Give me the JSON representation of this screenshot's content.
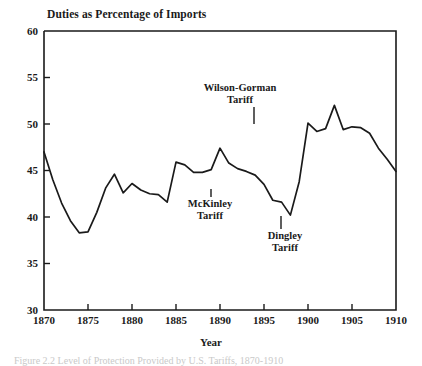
{
  "figure": {
    "title": "Duties as Percentage of Imports",
    "xlabel": "Year",
    "caption": "Figure 2.2 Level of Protection Provided by U.S. Tariffs, 1870-1910"
  },
  "axes": {
    "y_ticks": [
      "60",
      "55",
      "50",
      "45",
      "40",
      "35",
      "30"
    ],
    "x_ticks": [
      "1870",
      "1875",
      "1880",
      "1885",
      "1890",
      "1895",
      "1900",
      "1905",
      "1910"
    ]
  },
  "annotations": [
    {
      "name": "wilson-gorman",
      "line1": "Wilson-Gorman",
      "line2": "Tariff"
    },
    {
      "name": "mckinley",
      "line1": "McKinley",
      "line2": "Tariff"
    },
    {
      "name": "dingley",
      "line1": "Dingley",
      "line2": "Tariff"
    }
  ],
  "chart_data": {
    "type": "line",
    "title": "Duties as Percentage of Imports",
    "xlabel": "Year",
    "ylabel": "",
    "xlim": [
      1870,
      1910
    ],
    "ylim": [
      30,
      60
    ],
    "grid": false,
    "legend": null,
    "x": [
      1870,
      1871,
      1872,
      1873,
      1874,
      1875,
      1876,
      1877,
      1878,
      1879,
      1880,
      1881,
      1882,
      1883,
      1884,
      1885,
      1886,
      1887,
      1888,
      1889,
      1890,
      1891,
      1892,
      1893,
      1894,
      1895,
      1896,
      1897,
      1898,
      1899,
      1900,
      1901,
      1902,
      1903,
      1904,
      1905,
      1906,
      1907,
      1908,
      1909,
      1910
    ],
    "values": [
      47.0,
      44.0,
      41.5,
      39.6,
      38.3,
      38.4,
      40.5,
      43.1,
      44.6,
      42.6,
      43.6,
      42.9,
      42.5,
      42.4,
      41.6,
      45.9,
      45.6,
      44.8,
      44.8,
      45.1,
      47.4,
      45.8,
      45.2,
      44.9,
      44.5,
      43.5,
      41.8,
      41.6,
      40.2,
      43.8,
      50.1,
      49.2,
      49.5,
      52.0,
      49.4,
      49.7,
      49.6,
      49.0,
      47.4,
      46.2,
      44.9
    ],
    "annotations": [
      {
        "label": "Wilson-Gorman Tariff",
        "x": 1894,
        "y": 49.5
      },
      {
        "label": "McKinley Tariff",
        "x": 1890,
        "y": 47.4
      },
      {
        "label": "Dingley Tariff",
        "x": 1897,
        "y": 41.6
      }
    ]
  }
}
